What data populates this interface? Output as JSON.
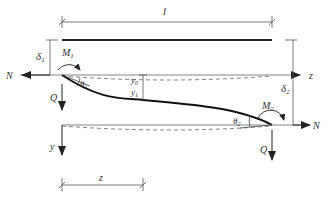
{
  "diagram": {
    "labels": {
      "length": "l",
      "delta1": "δ",
      "delta1_sub": "1",
      "delta2": "δ",
      "delta2_sub": "2",
      "moment1": "M",
      "moment1_sub": "1",
      "moment2": "M",
      "moment2_sub": "2",
      "theta1": "θ",
      "theta1_sub": "1",
      "theta2": "θ",
      "theta2_sub": "2",
      "y0": "y",
      "y0_sub": "0",
      "y1": "y",
      "y1_sub": "1",
      "axial_left": "N",
      "axial_right": "N",
      "shear_left": "Q",
      "shear_right": "Q",
      "z_axis": "z",
      "y_axis": "y",
      "z_dim": "z"
    },
    "colors": {
      "stroke": "#333333",
      "thin": "#555555"
    }
  }
}
